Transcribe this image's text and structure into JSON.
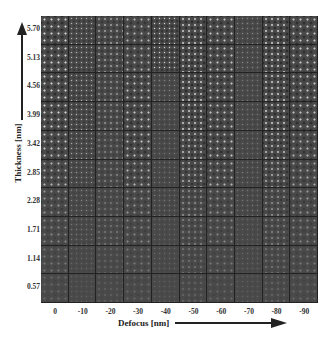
{
  "figure": {
    "y_axis": {
      "title": "Thickness [nm]",
      "ticks": [
        "5.70",
        "5.13",
        "4.56",
        "3.99",
        "3.42",
        "2.85",
        "2.28",
        "1.71",
        "1.14",
        "0.57"
      ]
    },
    "x_axis": {
      "title": "Defocus [nm]",
      "ticks": [
        "0",
        "-10",
        "-20",
        "-30",
        "-40",
        "-50",
        "-60",
        "-70",
        "-80",
        "-90"
      ]
    },
    "grid": {
      "rows": 10,
      "cols": 10,
      "description": "Simulated HRTEM image tiles as a function of thickness (rows, top=thickest) and defocus (columns)",
      "contrast": [
        [
          0.9,
          0.7,
          0.6,
          0.7,
          0.9,
          0.9,
          0.8,
          0.4,
          0.9,
          0.8
        ],
        [
          0.9,
          0.7,
          0.6,
          0.7,
          0.9,
          0.9,
          0.8,
          0.4,
          0.9,
          0.8
        ],
        [
          0.9,
          0.7,
          0.5,
          0.8,
          0.4,
          0.9,
          0.8,
          0.3,
          0.9,
          0.8
        ],
        [
          0.9,
          0.7,
          0.5,
          0.8,
          0.3,
          0.9,
          0.8,
          0.3,
          0.9,
          0.8
        ],
        [
          0.8,
          0.6,
          0.4,
          0.8,
          0.3,
          0.8,
          0.8,
          0.3,
          0.8,
          0.7
        ],
        [
          0.7,
          0.5,
          0.4,
          0.7,
          0.3,
          0.7,
          0.7,
          0.3,
          0.7,
          0.6
        ],
        [
          0.5,
          0.4,
          0.3,
          0.5,
          0.3,
          0.5,
          0.5,
          0.3,
          0.5,
          0.5
        ],
        [
          0.4,
          0.3,
          0.3,
          0.4,
          0.2,
          0.4,
          0.4,
          0.2,
          0.4,
          0.4
        ],
        [
          0.3,
          0.2,
          0.2,
          0.3,
          0.2,
          0.3,
          0.3,
          0.2,
          0.3,
          0.3
        ],
        [
          0.2,
          0.15,
          0.15,
          0.2,
          0.15,
          0.2,
          0.2,
          0.15,
          0.2,
          0.2
        ]
      ]
    }
  }
}
